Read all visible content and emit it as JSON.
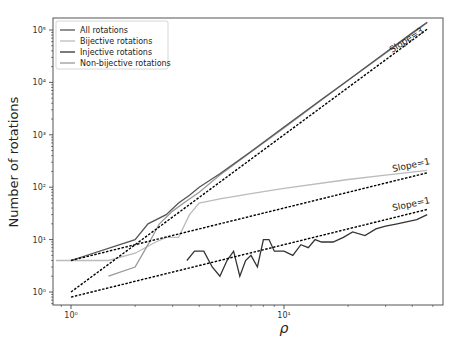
{
  "chart_data": {
    "type": "line",
    "title": "",
    "xlabel": "ρ",
    "ylabel": "Number of rotations",
    "xscale": "log",
    "yscale": "log",
    "xlim": [
      0.85,
      56
    ],
    "ylim": [
      0.6,
      120000
    ],
    "x_ticks": [
      {
        "value": 1,
        "label": "10⁰"
      },
      {
        "value": 10,
        "label": "10¹"
      }
    ],
    "y_ticks": [
      {
        "value": 1,
        "label": "10⁰"
      },
      {
        "value": 10,
        "label": "10¹"
      },
      {
        "value": 100,
        "label": "10²"
      },
      {
        "value": 1000,
        "label": "10³"
      },
      {
        "value": 10000,
        "label": "10⁴"
      },
      {
        "value": 100000,
        "label": "10⁵"
      }
    ],
    "grid": false,
    "legend_position": "upper left",
    "legend": [
      "All rotations",
      "Bijective rotations",
      "Injective rotations",
      "Non-bijective rotations"
    ],
    "series": [
      {
        "name": "All rotations",
        "color": "#555555",
        "x": [
          1,
          2,
          2.3,
          2.8,
          3.2,
          3.6,
          4,
          5,
          7,
          10,
          15,
          20,
          30,
          40,
          47
        ],
        "y": [
          4,
          10,
          20,
          30,
          50,
          70,
          100,
          180,
          480,
          1400,
          4700,
          11000,
          37000,
          88000,
          140000
        ]
      },
      {
        "name": "Bijective rotations",
        "color": "#bbbbbb",
        "x": [
          0.85,
          1,
          1.5,
          2,
          2.5,
          2.8,
          3.2,
          3.6,
          4,
          5,
          7,
          10,
          20,
          30,
          47
        ],
        "y": [
          4,
          4,
          4,
          5.5,
          9,
          11,
          11,
          30,
          50,
          60,
          75,
          95,
          140,
          170,
          210
        ]
      },
      {
        "name": "Injective rotations",
        "color": "#333333",
        "x": [
          3.5,
          3.8,
          4.2,
          4.6,
          5,
          5.4,
          5.8,
          6.2,
          6.6,
          7,
          7.5,
          8,
          8.5,
          9,
          10,
          11,
          12,
          13,
          14,
          15,
          17,
          19,
          21,
          24,
          27,
          30,
          34,
          38,
          42,
          47
        ],
        "y": [
          4,
          6,
          6,
          3,
          2,
          4,
          6,
          2,
          4,
          5,
          3,
          10,
          10,
          6,
          6,
          5,
          8,
          7,
          10,
          9,
          9,
          11,
          14,
          12,
          16,
          18,
          20,
          22,
          24,
          30
        ]
      },
      {
        "name": "Non-bijective rotations",
        "color": "#999999",
        "x": [
          1.5,
          2,
          2.3,
          2.6,
          3,
          3.5,
          4,
          5,
          7,
          10,
          20,
          30,
          47
        ],
        "y": [
          2,
          3,
          8,
          20,
          35,
          55,
          80,
          170,
          470,
          1350,
          11000,
          36000,
          138000
        ]
      }
    ],
    "reference_lines": [
      {
        "label": "Slope=3",
        "x": [
          1,
          47
        ],
        "y": [
          1,
          103823
        ],
        "style": "dashed",
        "color": "#000000"
      },
      {
        "label": "Slope=1",
        "x": [
          1,
          47
        ],
        "y": [
          4,
          188
        ],
        "style": "dashed",
        "color": "#000000"
      },
      {
        "label": "Slope=1",
        "x": [
          1,
          47
        ],
        "y": [
          0.8,
          37.6
        ],
        "style": "dashed",
        "color": "#000000"
      }
    ]
  },
  "labels": {
    "xlabel": "ρ",
    "ylabel": "Number of rotations",
    "slope3": "Slope=3",
    "slope1_upper": "Slope=1",
    "slope1_lower": "Slope=1"
  }
}
